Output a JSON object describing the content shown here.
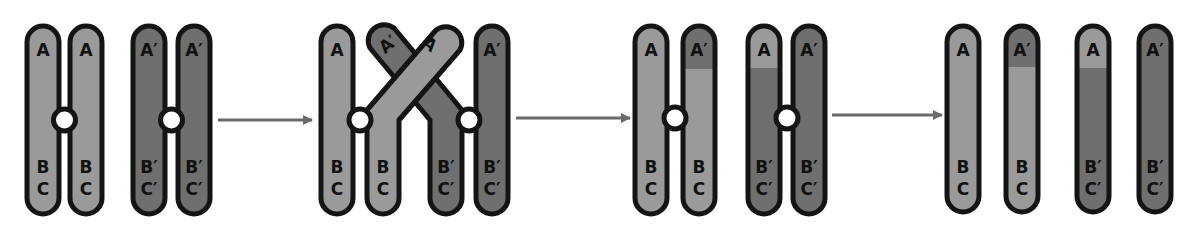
{
  "diagram": {
    "colors": {
      "light_chromatid": "#9a9a9a",
      "dark_chromatid": "#6f6f6f",
      "outline": "#141414",
      "centromere": "#ffffff",
      "arrow": "#6a6a6a",
      "background": "#ffffff"
    },
    "stages": [
      {
        "name": "homologous-pair",
        "chromatids": [
          {
            "top": "A",
            "mid": "B",
            "bot": "C",
            "shade": "light"
          },
          {
            "top": "A",
            "mid": "B",
            "bot": "C",
            "shade": "light"
          },
          {
            "top": "A′",
            "mid": "B′",
            "bot": "C′",
            "shade": "dark"
          },
          {
            "top": "A′",
            "mid": "B′",
            "bot": "C′",
            "shade": "dark"
          }
        ]
      },
      {
        "name": "crossing-over",
        "chromatids": [
          {
            "top": "A",
            "mid": "B",
            "bot": "C",
            "shade": "light"
          },
          {
            "top": "A",
            "mid": "B",
            "bot": "C",
            "shade": "light"
          },
          {
            "top": "A′",
            "mid": "B′",
            "bot": "C′",
            "shade": "dark"
          },
          {
            "top": "A′",
            "mid": "B′",
            "bot": "C′",
            "shade": "dark"
          }
        ]
      },
      {
        "name": "recombined-pair",
        "chromatids": [
          {
            "top": "A",
            "mid": "B",
            "bot": "C",
            "shade": "light"
          },
          {
            "top": "A′",
            "mid": "B",
            "bot": "C",
            "shade": "light-with-dark-tip"
          },
          {
            "top": "A",
            "mid": "B′",
            "bot": "C′",
            "shade": "dark-with-light-tip"
          },
          {
            "top": "A′",
            "mid": "B′",
            "bot": "C′",
            "shade": "dark"
          }
        ]
      },
      {
        "name": "separated-chromatids",
        "chromatids": [
          {
            "top": "A",
            "mid": "B",
            "bot": "C",
            "shade": "light"
          },
          {
            "top": "A′",
            "mid": "B",
            "bot": "C",
            "shade": "light-with-dark-tip"
          },
          {
            "top": "A",
            "mid": "B′",
            "bot": "C′",
            "shade": "dark-with-light-tip"
          },
          {
            "top": "A′",
            "mid": "B′",
            "bot": "C′",
            "shade": "dark"
          }
        ]
      }
    ],
    "arrows": [
      "arrow-1",
      "arrow-2",
      "arrow-3"
    ]
  }
}
